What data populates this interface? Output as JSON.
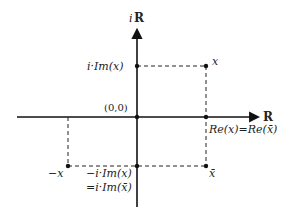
{
  "diagram": {
    "axes": {
      "real_label": "R",
      "imag_label_prefix": "i",
      "imag_label_set": "R"
    },
    "origin_label": "(0,0)",
    "points": {
      "x": "x",
      "x_bar": "x̄",
      "neg_x": "−x"
    },
    "labels": {
      "im_x": "i·Im(x)",
      "neg_im_x": "−i·Im(x)",
      "im_x_bar": "=i·Im(x̄)",
      "re_eq": "Re(x)=Re(x̄)"
    }
  }
}
